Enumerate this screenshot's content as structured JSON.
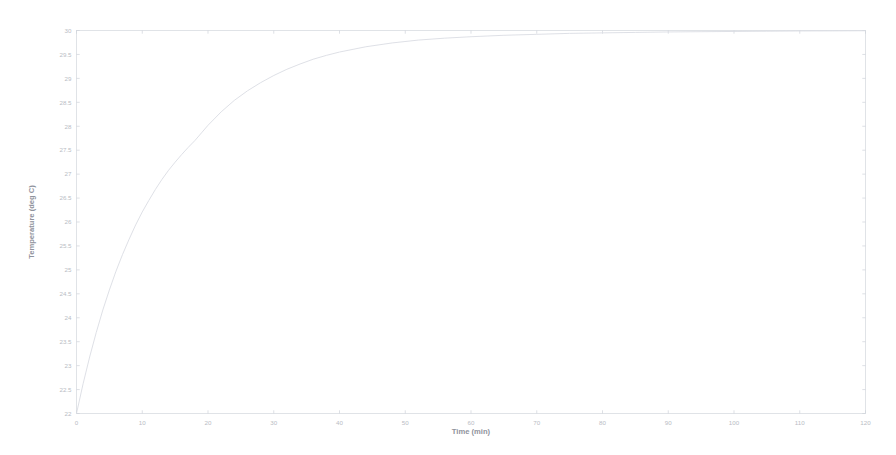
{
  "figure": {
    "background_color": "#ffffff",
    "axes_color": "#d9dce2",
    "line_color": "#dadde3",
    "tick_label_color": "#b9bcc4",
    "axis_title_color": "#8f939c"
  },
  "chart_data": {
    "type": "line",
    "title": "",
    "xlabel": "Time (min)",
    "ylabel": "Temperature (deg C)",
    "xlim": [
      0,
      120
    ],
    "ylim": [
      22,
      30
    ],
    "grid": false,
    "legend": null,
    "xticks": [
      0,
      10,
      20,
      30,
      40,
      50,
      60,
      70,
      80,
      90,
      100,
      110,
      120
    ],
    "xtick_labels": [
      "0",
      "10",
      "20",
      "30",
      "40",
      "50",
      "60",
      "70",
      "80",
      "90",
      "100",
      "110",
      "120"
    ],
    "yticks": [
      22,
      22.5,
      23,
      23.5,
      24,
      24.5,
      25,
      25.5,
      26,
      26.5,
      27,
      27.5,
      28,
      28.5,
      29,
      29.5,
      30
    ],
    "ytick_labels": [
      "22",
      "22.5",
      "23",
      "23.5",
      "24",
      "24.5",
      "25",
      "25.5",
      "26",
      "26.5",
      "27",
      "27.5",
      "28",
      "28.5",
      "29",
      "29.5",
      "30"
    ],
    "series": [
      {
        "name": "Temperature",
        "x": [
          0,
          1,
          2,
          3,
          4,
          5,
          6,
          7,
          8,
          9,
          10,
          11,
          12,
          13,
          14,
          15,
          16,
          17,
          18,
          19,
          20,
          22,
          24,
          26,
          28,
          30,
          32,
          34,
          36,
          38,
          40,
          44,
          48,
          52,
          56,
          60,
          65,
          70,
          75,
          80,
          85,
          90,
          95,
          100,
          105,
          110,
          115,
          120
        ],
        "y": [
          22.0,
          22.62,
          23.18,
          23.69,
          24.16,
          24.58,
          24.97,
          25.32,
          25.64,
          25.94,
          26.21,
          26.45,
          26.68,
          26.89,
          27.08,
          27.25,
          27.41,
          27.56,
          27.7,
          27.86,
          28.02,
          28.3,
          28.54,
          28.74,
          28.91,
          29.06,
          29.19,
          29.3,
          29.4,
          29.48,
          29.55,
          29.66,
          29.74,
          29.8,
          29.84,
          29.87,
          29.9,
          29.92,
          29.94,
          29.95,
          29.96,
          29.97,
          29.975,
          29.98,
          29.985,
          29.99,
          29.992,
          29.995
        ]
      }
    ]
  }
}
